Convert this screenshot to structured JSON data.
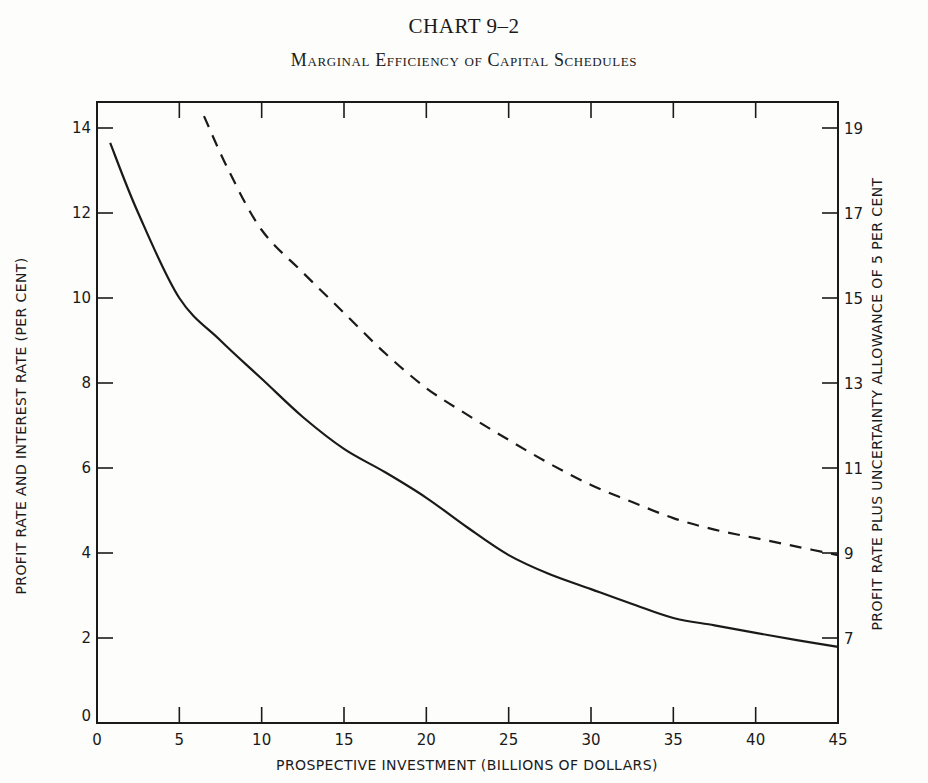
{
  "header": {
    "chart_number": "CHART 9–2",
    "title": "Marginal Efficiency of Capital Schedules"
  },
  "colors": {
    "background": "#fdfdfb",
    "ink": "#1a1a1a"
  },
  "chart_data": {
    "type": "line",
    "title": "Marginal Efficiency of Capital Schedules",
    "subtitle": "CHART 9–2",
    "xlabel": "PROSPECTIVE INVESTMENT (BILLIONS OF DOLLARS)",
    "ylabel": "PROFIT RATE AND INTEREST RATE (PER CENT)",
    "y2label": "PROFIT RATE PLUS UNCERTAINTY ALLOWANCE OF 5 PER CENT",
    "xlim": [
      0,
      45
    ],
    "ylim": [
      0,
      14.6
    ],
    "x_ticks": [
      0,
      5,
      10,
      15,
      20,
      25,
      30,
      35,
      40,
      45
    ],
    "y_ticks": [
      0,
      2,
      4,
      6,
      8,
      10,
      12,
      14
    ],
    "y2_ticks": [
      7,
      9,
      11,
      13,
      15,
      17,
      19
    ],
    "y2_offset": 5,
    "grid": false,
    "legend": null,
    "series": [
      {
        "name": "Profit rate (marginal efficiency of capital)",
        "style": "solid",
        "axis": "left",
        "x": [
          0.8,
          2.5,
          5,
          7.5,
          10,
          12.5,
          15,
          17.5,
          20,
          22.5,
          25,
          27.5,
          30,
          32.5,
          35,
          37.5,
          40,
          42.5,
          45
        ],
        "values": [
          13.65,
          12.0,
          10.0,
          9.0,
          8.1,
          7.2,
          6.45,
          5.9,
          5.3,
          4.6,
          3.95,
          3.5,
          3.15,
          2.8,
          2.47,
          2.3,
          2.12,
          1.95,
          1.79
        ]
      },
      {
        "name": "Profit rate plus uncertainty allowance of 5 per cent",
        "style": "dashed",
        "axis": "right",
        "x": [
          6.5,
          8,
          10,
          12.5,
          15,
          17.5,
          20,
          22.5,
          25,
          27.5,
          30,
          32.5,
          35,
          37.5,
          40,
          42.5,
          45
        ],
        "values": [
          19.28,
          18.0,
          16.6,
          15.6,
          14.65,
          13.7,
          12.88,
          12.25,
          11.66,
          11.1,
          10.6,
          10.2,
          9.82,
          9.55,
          9.35,
          9.15,
          8.95
        ]
      }
    ]
  }
}
